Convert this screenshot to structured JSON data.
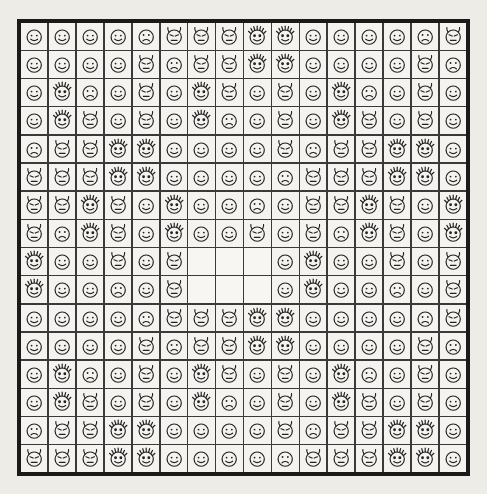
{
  "scene": {
    "kind": "face-icon-grid",
    "background_color": "#eeece7",
    "frame_color": "#1a1a1a",
    "grid_line_color": "#3a3a3a",
    "cell_color": "#f4f3ef",
    "ink_color": "#222222",
    "rows": 16,
    "cols": 16,
    "blank_region": {
      "row_start": 9,
      "row_end": 10,
      "col_start": 7,
      "col_end": 9
    }
  },
  "legend": {
    "face_types": [
      {
        "key": "smile",
        "label": "smiling-face",
        "eyes": "open-dots",
        "mouth": "smile",
        "has_horns": false,
        "has_rays": false
      },
      {
        "key": "sad",
        "label": "frowning-face",
        "eyes": "open-dots",
        "mouth": "frown",
        "has_horns": false,
        "has_rays": false
      },
      {
        "key": "devil",
        "label": "devil-face",
        "eyes": "angry-slits",
        "mouth": "flat",
        "has_horns": true,
        "has_rays": false
      },
      {
        "key": "sun",
        "label": "sun-ray-face",
        "eyes": "filled-dots",
        "mouth": "smile",
        "has_horns": false,
        "has_rays": true
      }
    ]
  },
  "grid_rows": [
    [
      "smile",
      "smile",
      "smile",
      "smile",
      "sad",
      "devil",
      "devil",
      "devil",
      "sun",
      "sun",
      "smile",
      "smile",
      "smile",
      "smile",
      "sad",
      "devil"
    ],
    [
      "smile",
      "smile",
      "smile",
      "smile",
      "devil",
      "sad",
      "devil",
      "devil",
      "sun",
      "sun",
      "smile",
      "smile",
      "smile",
      "smile",
      "devil",
      "sad"
    ],
    [
      "smile",
      "sun",
      "sad",
      "smile",
      "devil",
      "smile",
      "sun",
      "devil",
      "smile",
      "devil",
      "smile",
      "sun",
      "sad",
      "smile",
      "devil",
      "smile"
    ],
    [
      "smile",
      "sun",
      "devil",
      "smile",
      "devil",
      "smile",
      "sun",
      "sad",
      "smile",
      "devil",
      "smile",
      "sun",
      "devil",
      "smile",
      "devil",
      "smile"
    ],
    [
      "sad",
      "devil",
      "devil",
      "sun",
      "sun",
      "smile",
      "smile",
      "smile",
      "smile",
      "devil",
      "sad",
      "devil",
      "devil",
      "sun",
      "sun",
      "smile"
    ],
    [
      "devil",
      "devil",
      "devil",
      "sun",
      "sun",
      "smile",
      "smile",
      "smile",
      "smile",
      "sad",
      "devil",
      "devil",
      "devil",
      "sun",
      "sun",
      "smile"
    ],
    [
      "devil",
      "devil",
      "sun",
      "devil",
      "smile",
      "sun",
      "smile",
      "smile",
      "sad",
      "smile",
      "devil",
      "devil",
      "sun",
      "devil",
      "smile",
      "sun"
    ],
    [
      "devil",
      "sad",
      "sun",
      "devil",
      "smile",
      "sun",
      "smile",
      "smile",
      "devil",
      "smile",
      "devil",
      "sad",
      "sun",
      "devil",
      "smile",
      "sun"
    ],
    [
      "sun",
      "smile",
      "smile",
      "devil",
      "smile",
      "devil",
      "blank",
      "blank",
      "blank",
      "smile",
      "sun",
      "smile",
      "smile",
      "devil",
      "smile",
      "devil"
    ],
    [
      "sun",
      "smile",
      "smile",
      "sad",
      "smile",
      "devil",
      "blank",
      "blank",
      "blank",
      "smile",
      "sun",
      "smile",
      "smile",
      "sad",
      "smile",
      "devil"
    ],
    [
      "smile",
      "smile",
      "smile",
      "smile",
      "sad",
      "devil",
      "devil",
      "devil",
      "sun",
      "sun",
      "smile",
      "smile",
      "smile",
      "smile",
      "sad",
      "devil"
    ],
    [
      "smile",
      "smile",
      "smile",
      "smile",
      "devil",
      "sad",
      "devil",
      "devil",
      "sun",
      "sun",
      "smile",
      "smile",
      "smile",
      "smile",
      "devil",
      "sad"
    ],
    [
      "smile",
      "sun",
      "sad",
      "smile",
      "devil",
      "smile",
      "sun",
      "devil",
      "smile",
      "devil",
      "smile",
      "sun",
      "sad",
      "smile",
      "devil",
      "smile"
    ],
    [
      "smile",
      "sun",
      "devil",
      "smile",
      "devil",
      "smile",
      "sun",
      "sad",
      "smile",
      "devil",
      "smile",
      "sun",
      "devil",
      "smile",
      "devil",
      "smile"
    ],
    [
      "sad",
      "devil",
      "devil",
      "sun",
      "sun",
      "smile",
      "smile",
      "smile",
      "smile",
      "devil",
      "sad",
      "devil",
      "devil",
      "sun",
      "sun",
      "smile"
    ],
    [
      "devil",
      "devil",
      "devil",
      "sun",
      "sun",
      "smile",
      "smile",
      "smile",
      "smile",
      "sad",
      "devil",
      "devil",
      "devil",
      "sun",
      "sun",
      "smile"
    ]
  ]
}
